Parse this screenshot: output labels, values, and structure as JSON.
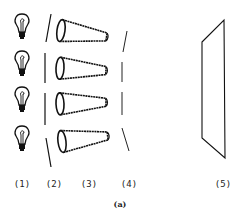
{
  "diagram": {
    "components": [
      {
        "id": "1",
        "label": "(1)",
        "name": "light-bulbs",
        "count": 4
      },
      {
        "id": "2",
        "label": "(2)",
        "name": "first-slits",
        "count": 4
      },
      {
        "id": "3",
        "label": "(3)",
        "name": "cones",
        "count": 4
      },
      {
        "id": "4",
        "label": "(4)",
        "name": "second-slits",
        "count": 4
      },
      {
        "id": "5",
        "label": "(5)",
        "name": "screen-panel",
        "count": 1
      }
    ],
    "caption": "(a)"
  }
}
